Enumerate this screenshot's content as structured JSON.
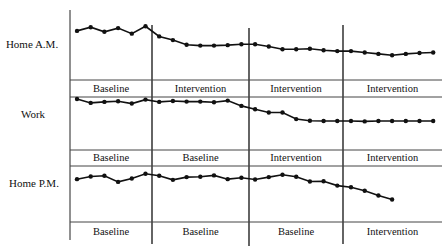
{
  "chart_data": {
    "type": "line",
    "title": "",
    "xlabel": "",
    "ylabel": "",
    "grid": false,
    "legend": "none",
    "ylim": [
      0,
      10
    ],
    "x_count": 27,
    "phase_boundaries_after_index": [
      6,
      13,
      20
    ],
    "series": [
      {
        "name": "Home A.M.",
        "values": [
          7.2,
          8.0,
          7.0,
          7.8,
          6.6,
          8.2,
          6.0,
          5.2,
          4.2,
          4.0,
          4.0,
          4.1,
          4.3,
          4.3,
          3.8,
          3.2,
          3.2,
          3.3,
          3.0,
          2.8,
          2.8,
          2.5,
          2.2,
          1.9,
          2.2,
          2.4,
          2.5
        ],
        "phases": [
          "Baseline",
          "Intervention",
          "Intervention",
          "Intervention"
        ]
      },
      {
        "name": "Work",
        "values": [
          8.5,
          7.3,
          7.6,
          7.8,
          7.1,
          8.3,
          7.6,
          7.9,
          7.7,
          7.7,
          7.5,
          8.0,
          6.4,
          5.4,
          4.4,
          4.4,
          2.4,
          1.9,
          1.8,
          1.8,
          1.8,
          1.7,
          1.8,
          1.8,
          1.8,
          1.8,
          1.8
        ],
        "phases": [
          "Baseline",
          "Baseline",
          "Intervention",
          "Intervention"
        ]
      },
      {
        "name": "Home P.M.",
        "values": [
          7.6,
          8.4,
          8.6,
          6.8,
          7.8,
          9.2,
          8.6,
          7.4,
          8.2,
          8.3,
          8.7,
          7.6,
          8.0,
          7.5,
          8.2,
          8.9,
          8.3,
          6.9,
          7.0,
          5.7,
          5.2,
          4.2,
          2.8,
          1.6
        ],
        "phases": [
          "Baseline",
          "Baseline",
          "Baseline",
          "Intervention"
        ]
      }
    ]
  }
}
